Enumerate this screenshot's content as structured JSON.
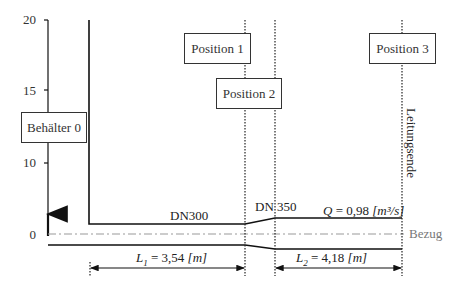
{
  "axis": {
    "ticks": [
      "20",
      "15",
      "10",
      "0"
    ]
  },
  "boxes": {
    "tank": "Behälter 0",
    "position1": "Position 1",
    "position2": "Position 2",
    "position3": "Position 3"
  },
  "pipes": {
    "segment1_label": "DN300",
    "segment2_label": "DN 350"
  },
  "flow": {
    "symbol": "Q",
    "equals": " = 0,98 ",
    "unit": "[m³/s]"
  },
  "reference": {
    "label": "Bezug"
  },
  "line_end": {
    "label": "Leitungsende"
  },
  "dimensions": {
    "l1": {
      "symbol": "L",
      "sub": "1",
      "rest": " = 3,54 ",
      "unit": "[m]"
    },
    "l2": {
      "symbol": "L",
      "sub": "2",
      "rest": " = 4,18 ",
      "unit": "[m]"
    }
  },
  "colors": {
    "line": "#111111",
    "reference_line": "#888888",
    "text_gray": "#777777"
  }
}
